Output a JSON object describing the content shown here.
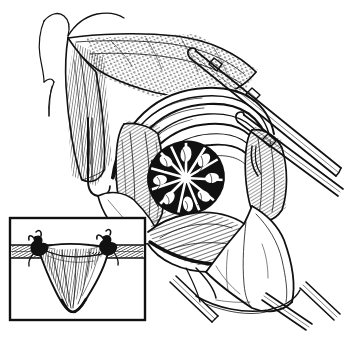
{
  "figure": {
    "title": "Surgical exposure line drawing",
    "medium": "pen-and-ink line art",
    "palette": {
      "ink": "#111111",
      "background": "#ffffff",
      "shadow": "#000000"
    },
    "canvas": {
      "width": 345,
      "height": 338
    },
    "has_text_labels": false,
    "label_text": ""
  },
  "main_illustration": {
    "name": "operative-field",
    "description": "Deep surgical exposure with retracted tissue flaps, arching muscle fibers and a dark radially striated structure at the center of the wound",
    "regions": [
      {
        "id": "body-contour",
        "label": "patient body outline",
        "location": "upper left"
      },
      {
        "id": "tissue-flap-upper",
        "label": "retracted upper tissue flap",
        "location": "top center"
      },
      {
        "id": "tissue-flap-left",
        "label": "retracted left tissue flap",
        "location": "left"
      },
      {
        "id": "muscle-bands",
        "label": "arching muscle fiber bands",
        "location": "upper center"
      },
      {
        "id": "central-structure",
        "label": "dark radially striated structure",
        "location": "center"
      },
      {
        "id": "tissue-bed-lower",
        "label": "lower tissue bed",
        "location": "lower center"
      },
      {
        "id": "retractor-blade",
        "label": "broad retractor blade",
        "location": "lower right"
      }
    ],
    "instruments": [
      {
        "id": "retractor-rod-upper",
        "label": "upper retractor rod",
        "orientation": "diagonal upper right"
      },
      {
        "id": "retractor-rod-middle",
        "label": "middle retractor rod",
        "orientation": "diagonal right"
      },
      {
        "id": "retractor-hook-left",
        "label": "left retractor hook",
        "orientation": "vertical left"
      },
      {
        "id": "instrument-shaft-lower",
        "label": "lower instrument shaft",
        "orientation": "diagonal lower right"
      }
    ]
  },
  "inset_panel": {
    "name": "detail-inset",
    "description": "Cross-sectional detail of a V-shaped tissue wedge suspended between two horizontal bands and secured by ligature knots at each side",
    "frame": {
      "x": 10,
      "y": 218,
      "width": 135,
      "height": 102
    },
    "elements": [
      {
        "id": "band-left",
        "label": "left horizontal band"
      },
      {
        "id": "band-right",
        "label": "right horizontal band"
      },
      {
        "id": "knot-left",
        "label": "left ligature knot"
      },
      {
        "id": "knot-right",
        "label": "right ligature knot"
      },
      {
        "id": "tissue-wedge",
        "label": "V-shaped tissue wedge"
      }
    ]
  }
}
